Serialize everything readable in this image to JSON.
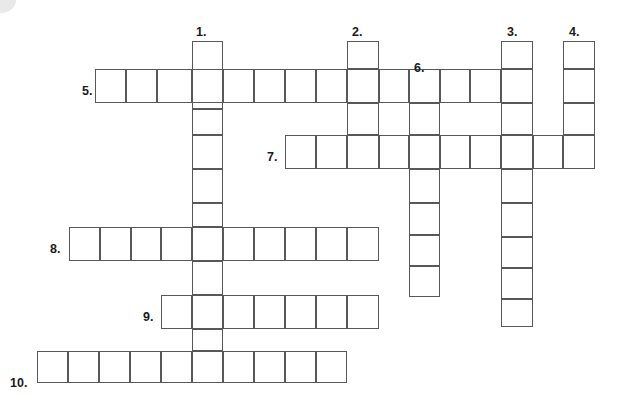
{
  "puzzle": {
    "type": "crossword-grid",
    "title": "Blank crossword puzzle grid",
    "cell_size": 31,
    "origin": {
      "x": 37,
      "y": 41
    },
    "colors": {
      "cell_border": "#58585a",
      "cell_fill": "#ffffff",
      "number_text": "#1a1a1a",
      "background": "#ffffff"
    },
    "entries": [
      {
        "number": "1.",
        "direction": "down",
        "label_x": 196,
        "label_y": 26,
        "col": 5,
        "row": 0,
        "length": 11
      },
      {
        "number": "2.",
        "direction": "down",
        "label_x": 352,
        "label_y": 26,
        "col": 10,
        "row": 0,
        "length": 7
      },
      {
        "number": "3.",
        "direction": "down",
        "label_x": 507,
        "label_y": 26,
        "col": 15,
        "row": 0,
        "length": 9
      },
      {
        "number": "4.",
        "direction": "down",
        "label_x": 569,
        "label_y": 26,
        "col": 17,
        "row": 0,
        "length": 4
      },
      {
        "number": "5.",
        "direction": "across",
        "label_x": 82,
        "label_y": 85,
        "col": 2,
        "row": 1,
        "length": 14
      },
      {
        "number": "6.",
        "direction": "down",
        "label_x": 414,
        "label_y": 62,
        "col": 12,
        "row": 1,
        "length": 8
      },
      {
        "number": "7.",
        "direction": "across",
        "label_x": 267,
        "label_y": 151,
        "col": 8,
        "row": 3,
        "length": 10
      },
      {
        "number": "8.",
        "direction": "across",
        "label_x": 50,
        "label_y": 243,
        "col": 1,
        "row": 6,
        "length": 10
      },
      {
        "number": "9.",
        "direction": "across",
        "label_x": 143,
        "label_y": 311,
        "col": 4,
        "row": 8,
        "length": 7
      },
      {
        "number": "10.",
        "direction": "across",
        "label_x": 10,
        "label_y": 377,
        "col": 0,
        "row": 10,
        "length": 10
      }
    ],
    "cells": [
      {
        "name": "down-1",
        "x": 192,
        "y": 41,
        "w": 31,
        "h": 34
      },
      {
        "name": "down-1",
        "x": 192,
        "y": 75,
        "w": 31,
        "h": 34
      },
      {
        "name": "down-1",
        "x": 192,
        "y": 109,
        "w": 31,
        "h": 26
      },
      {
        "name": "down-1",
        "x": 192,
        "y": 135,
        "w": 31,
        "h": 34
      },
      {
        "name": "down-1",
        "x": 192,
        "y": 169,
        "w": 31,
        "h": 34
      },
      {
        "name": "down-1",
        "x": 192,
        "y": 203,
        "w": 31,
        "h": 24
      },
      {
        "name": "down-1",
        "x": 192,
        "y": 227,
        "w": 31,
        "h": 34
      },
      {
        "name": "down-1",
        "x": 192,
        "y": 261,
        "w": 31,
        "h": 34
      },
      {
        "name": "down-1",
        "x": 192,
        "y": 295,
        "w": 31,
        "h": 34
      },
      {
        "name": "down-1",
        "x": 192,
        "y": 329,
        "w": 31,
        "h": 22
      },
      {
        "name": "down-1",
        "x": 192,
        "y": 351,
        "w": 31,
        "h": 32
      },
      {
        "name": "down-2",
        "x": 347,
        "y": 41,
        "w": 32,
        "h": 28
      },
      {
        "name": "down-2",
        "x": 347,
        "y": 69,
        "w": 32,
        "h": 34
      },
      {
        "name": "down-2",
        "x": 347,
        "y": 103,
        "w": 32,
        "h": 32
      },
      {
        "name": "down-2",
        "x": 347,
        "y": 135,
        "w": 32,
        "h": 34
      },
      {
        "name": "down-3",
        "x": 501,
        "y": 41,
        "w": 32,
        "h": 28
      },
      {
        "name": "down-3",
        "x": 501,
        "y": 69,
        "w": 32,
        "h": 34
      },
      {
        "name": "down-3",
        "x": 501,
        "y": 103,
        "w": 32,
        "h": 32
      },
      {
        "name": "down-3",
        "x": 501,
        "y": 135,
        "w": 32,
        "h": 34
      },
      {
        "name": "down-3",
        "x": 501,
        "y": 169,
        "w": 32,
        "h": 34
      },
      {
        "name": "down-3",
        "x": 501,
        "y": 203,
        "w": 32,
        "h": 34
      },
      {
        "name": "down-3",
        "x": 501,
        "y": 237,
        "w": 32,
        "h": 31
      },
      {
        "name": "down-3",
        "x": 501,
        "y": 268,
        "w": 32,
        "h": 31
      },
      {
        "name": "down-3",
        "x": 501,
        "y": 299,
        "w": 32,
        "h": 28
      },
      {
        "name": "down-4",
        "x": 563,
        "y": 41,
        "w": 32,
        "h": 28
      },
      {
        "name": "down-4",
        "x": 563,
        "y": 69,
        "w": 32,
        "h": 34
      },
      {
        "name": "down-4",
        "x": 563,
        "y": 103,
        "w": 32,
        "h": 32
      },
      {
        "name": "down-4",
        "x": 563,
        "y": 135,
        "w": 32,
        "h": 34
      },
      {
        "name": "across-5",
        "x": 95,
        "y": 69,
        "w": 31,
        "h": 34
      },
      {
        "name": "across-5",
        "x": 126,
        "y": 69,
        "w": 31,
        "h": 34
      },
      {
        "name": "across-5",
        "x": 157,
        "y": 69,
        "w": 35,
        "h": 34
      },
      {
        "name": "across-5",
        "x": 192,
        "y": 69,
        "w": 31,
        "h": 34
      },
      {
        "name": "across-5",
        "x": 223,
        "y": 69,
        "w": 31,
        "h": 34
      },
      {
        "name": "across-5",
        "x": 254,
        "y": 69,
        "w": 31,
        "h": 34
      },
      {
        "name": "across-5",
        "x": 285,
        "y": 69,
        "w": 31,
        "h": 34
      },
      {
        "name": "across-5",
        "x": 316,
        "y": 69,
        "w": 31,
        "h": 34
      },
      {
        "name": "across-5",
        "x": 347,
        "y": 69,
        "w": 32,
        "h": 34
      },
      {
        "name": "across-5",
        "x": 379,
        "y": 69,
        "w": 30,
        "h": 34
      },
      {
        "name": "across-5",
        "x": 409,
        "y": 69,
        "w": 31,
        "h": 34
      },
      {
        "name": "across-5",
        "x": 440,
        "y": 69,
        "w": 30,
        "h": 34
      },
      {
        "name": "across-5",
        "x": 470,
        "y": 69,
        "w": 31,
        "h": 34
      },
      {
        "name": "across-5",
        "x": 501,
        "y": 69,
        "w": 32,
        "h": 34
      },
      {
        "name": "down-6",
        "x": 409,
        "y": 69,
        "w": 31,
        "h": 34
      },
      {
        "name": "down-6",
        "x": 409,
        "y": 103,
        "w": 31,
        "h": 32
      },
      {
        "name": "down-6",
        "x": 409,
        "y": 135,
        "w": 31,
        "h": 34
      },
      {
        "name": "down-6",
        "x": 409,
        "y": 169,
        "w": 31,
        "h": 34
      },
      {
        "name": "down-6",
        "x": 409,
        "y": 203,
        "w": 31,
        "h": 32
      },
      {
        "name": "down-6",
        "x": 409,
        "y": 235,
        "w": 31,
        "h": 31
      },
      {
        "name": "down-6",
        "x": 409,
        "y": 266,
        "w": 31,
        "h": 31
      },
      {
        "name": "across-7",
        "x": 285,
        "y": 135,
        "w": 31,
        "h": 34
      },
      {
        "name": "across-7",
        "x": 316,
        "y": 135,
        "w": 31,
        "h": 34
      },
      {
        "name": "across-7",
        "x": 347,
        "y": 135,
        "w": 32,
        "h": 34
      },
      {
        "name": "across-7",
        "x": 379,
        "y": 135,
        "w": 30,
        "h": 34
      },
      {
        "name": "across-7",
        "x": 409,
        "y": 135,
        "w": 31,
        "h": 34
      },
      {
        "name": "across-7",
        "x": 440,
        "y": 135,
        "w": 30,
        "h": 34
      },
      {
        "name": "across-7",
        "x": 470,
        "y": 135,
        "w": 31,
        "h": 34
      },
      {
        "name": "across-7",
        "x": 501,
        "y": 135,
        "w": 32,
        "h": 34
      },
      {
        "name": "across-7",
        "x": 533,
        "y": 135,
        "w": 30,
        "h": 34
      },
      {
        "name": "across-7",
        "x": 563,
        "y": 135,
        "w": 32,
        "h": 34
      },
      {
        "name": "across-8",
        "x": 69,
        "y": 227,
        "w": 31,
        "h": 34
      },
      {
        "name": "across-8",
        "x": 100,
        "y": 227,
        "w": 31,
        "h": 34
      },
      {
        "name": "across-8",
        "x": 131,
        "y": 227,
        "w": 30,
        "h": 34
      },
      {
        "name": "across-8",
        "x": 161,
        "y": 227,
        "w": 31,
        "h": 34
      },
      {
        "name": "across-8",
        "x": 192,
        "y": 227,
        "w": 31,
        "h": 34
      },
      {
        "name": "across-8",
        "x": 223,
        "y": 227,
        "w": 31,
        "h": 34
      },
      {
        "name": "across-8",
        "x": 254,
        "y": 227,
        "w": 31,
        "h": 34
      },
      {
        "name": "across-8",
        "x": 285,
        "y": 227,
        "w": 31,
        "h": 34
      },
      {
        "name": "across-8",
        "x": 316,
        "y": 227,
        "w": 31,
        "h": 34
      },
      {
        "name": "across-8",
        "x": 347,
        "y": 227,
        "w": 32,
        "h": 34
      },
      {
        "name": "across-9",
        "x": 161,
        "y": 295,
        "w": 31,
        "h": 34
      },
      {
        "name": "across-9",
        "x": 192,
        "y": 295,
        "w": 31,
        "h": 34
      },
      {
        "name": "across-9",
        "x": 223,
        "y": 295,
        "w": 31,
        "h": 34
      },
      {
        "name": "across-9",
        "x": 254,
        "y": 295,
        "w": 31,
        "h": 34
      },
      {
        "name": "across-9",
        "x": 285,
        "y": 295,
        "w": 31,
        "h": 34
      },
      {
        "name": "across-9",
        "x": 316,
        "y": 295,
        "w": 31,
        "h": 34
      },
      {
        "name": "across-9",
        "x": 347,
        "y": 295,
        "w": 32,
        "h": 34
      },
      {
        "name": "across-10",
        "x": 37,
        "y": 351,
        "w": 31,
        "h": 32
      },
      {
        "name": "across-10",
        "x": 68,
        "y": 351,
        "w": 31,
        "h": 32
      },
      {
        "name": "across-10",
        "x": 99,
        "y": 351,
        "w": 31,
        "h": 32
      },
      {
        "name": "across-10",
        "x": 130,
        "y": 351,
        "w": 31,
        "h": 32
      },
      {
        "name": "across-10",
        "x": 161,
        "y": 351,
        "w": 31,
        "h": 32
      },
      {
        "name": "across-10",
        "x": 192,
        "y": 351,
        "w": 31,
        "h": 32
      },
      {
        "name": "across-10",
        "x": 223,
        "y": 351,
        "w": 31,
        "h": 32
      },
      {
        "name": "across-10",
        "x": 254,
        "y": 351,
        "w": 31,
        "h": 32
      },
      {
        "name": "across-10",
        "x": 285,
        "y": 351,
        "w": 31,
        "h": 32
      },
      {
        "name": "across-10",
        "x": 316,
        "y": 351,
        "w": 31,
        "h": 32
      }
    ]
  },
  "chart_data": {
    "type": "table",
    "across": [
      {
        "number": 5,
        "length": 14
      },
      {
        "number": 7,
        "length": 10
      },
      {
        "number": 8,
        "length": 10
      },
      {
        "number": 9,
        "length": 7
      },
      {
        "number": 10,
        "length": 10
      }
    ],
    "down": [
      {
        "number": 1,
        "length": 11
      },
      {
        "number": 2,
        "length": 4
      },
      {
        "number": 3,
        "length": 9
      },
      {
        "number": 4,
        "length": 4
      },
      {
        "number": 6,
        "length": 7
      }
    ]
  }
}
